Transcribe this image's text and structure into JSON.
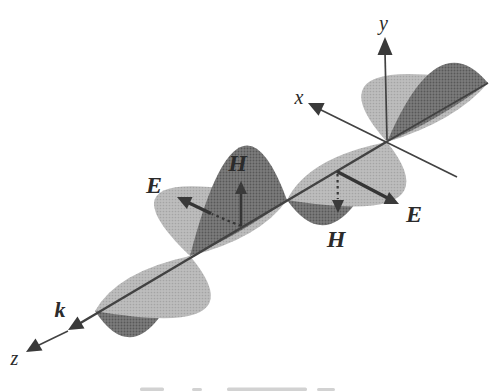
{
  "figure": {
    "colors": {
      "background": "#ffffff",
      "light_lobe_base": "#bdbdbd",
      "light_lobe_dot": "#a4a4a4",
      "dark_lobe_base": "#7c7c7c",
      "dark_lobe_dot": "#585858",
      "line": "#424242",
      "label": "#2b2b2b"
    },
    "labels": {
      "y_axis": "y",
      "x_axis": "x",
      "z_axis": "z",
      "wave_vector": "k",
      "e_field_left": "E",
      "e_field_right": "E",
      "h_field_top": "H",
      "h_field_bottom": "H"
    }
  }
}
